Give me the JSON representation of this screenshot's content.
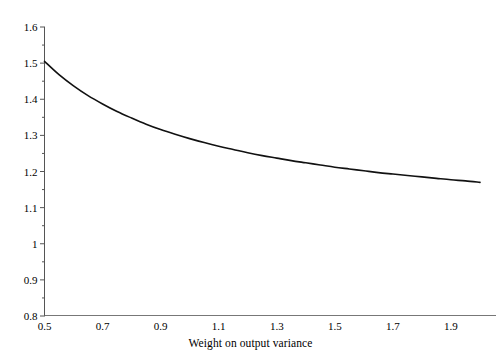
{
  "chart_data": {
    "type": "line",
    "title": "",
    "subtitle": "",
    "xlabel": "Weight on output variance",
    "ylabel": "",
    "xlim": [
      0.5,
      2.0
    ],
    "ylim": [
      0.8,
      1.6
    ],
    "grid": false,
    "legend": null,
    "legend_position": "none",
    "xticks": [
      "0.5",
      "0.7",
      "0.9",
      "1.1",
      "1.3",
      "1.5",
      "1.7",
      "1.9"
    ],
    "xtick_values": [
      0.5,
      0.7,
      0.9,
      1.1,
      1.3,
      1.5,
      1.7,
      1.9
    ],
    "yticks": [
      "0.8",
      "0.9",
      "1",
      "1.1",
      "1.2",
      "1.3",
      "1.4",
      "1.5",
      "1.6"
    ],
    "ytick_values": [
      0.8,
      0.9,
      1.0,
      1.1,
      1.2,
      1.3,
      1.4,
      1.5,
      1.6
    ],
    "yminor_values": [
      0.85,
      0.95,
      1.05,
      1.15,
      1.25,
      1.35,
      1.45,
      1.55
    ],
    "series": [
      {
        "name": "curve",
        "color": "#111111",
        "x": [
          0.5,
          0.55,
          0.6,
          0.65,
          0.7,
          0.75,
          0.8,
          0.85,
          0.9,
          0.95,
          1.0,
          1.05,
          1.1,
          1.15,
          1.2,
          1.25,
          1.3,
          1.35,
          1.4,
          1.45,
          1.5,
          1.55,
          1.6,
          1.65,
          1.7,
          1.75,
          1.8,
          1.85,
          1.9,
          1.95,
          2.0
        ],
        "values": [
          1.505,
          1.468,
          1.437,
          1.41,
          1.387,
          1.366,
          1.348,
          1.331,
          1.316,
          1.303,
          1.291,
          1.28,
          1.27,
          1.261,
          1.252,
          1.244,
          1.237,
          1.23,
          1.224,
          1.218,
          1.212,
          1.207,
          1.202,
          1.197,
          1.193,
          1.189,
          1.185,
          1.181,
          1.177,
          1.174,
          1.17
        ]
      }
    ]
  },
  "axes": {
    "line_color": "#555555",
    "curve_color": "#111111"
  }
}
